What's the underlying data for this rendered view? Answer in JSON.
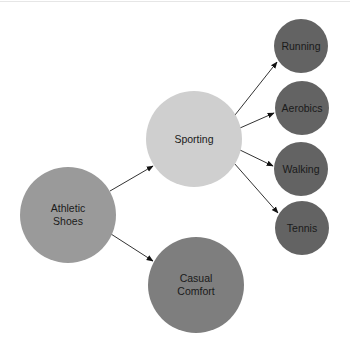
{
  "diagram": {
    "type": "hierarchy",
    "nodes": [
      {
        "id": "athletic",
        "label_lines": [
          "Athletic",
          "Shoes"
        ],
        "color": "#9a9a9a",
        "cx": 68,
        "cy": 215,
        "r": 48
      },
      {
        "id": "sporting",
        "label_lines": [
          "Sporting"
        ],
        "color": "#cfcfcf",
        "cx": 194,
        "cy": 139,
        "r": 48
      },
      {
        "id": "casual",
        "label_lines": [
          "Casual",
          "Comfort"
        ],
        "color": "#7e7e7e",
        "cx": 196,
        "cy": 285,
        "r": 48
      },
      {
        "id": "running",
        "label_lines": [
          "Running"
        ],
        "color": "#636363",
        "cx": 301,
        "cy": 46,
        "r": 27
      },
      {
        "id": "aerobics",
        "label_lines": [
          "Aerobics"
        ],
        "color": "#636363",
        "cx": 302,
        "cy": 108,
        "r": 27
      },
      {
        "id": "walking",
        "label_lines": [
          "Walking"
        ],
        "color": "#636363",
        "cx": 301,
        "cy": 169,
        "r": 27
      },
      {
        "id": "tennis",
        "label_lines": [
          "Tennis"
        ],
        "color": "#636363",
        "cx": 302,
        "cy": 228,
        "r": 27
      }
    ],
    "edges": [
      {
        "from": "athletic",
        "to": "sporting"
      },
      {
        "from": "athletic",
        "to": "casual"
      },
      {
        "from": "sporting",
        "to": "running"
      },
      {
        "from": "sporting",
        "to": "aerobics"
      },
      {
        "from": "sporting",
        "to": "walking"
      },
      {
        "from": "sporting",
        "to": "tennis"
      }
    ]
  },
  "labels": {
    "athletic_1": "Athletic",
    "athletic_2": "Shoes",
    "sporting": "Sporting",
    "casual_1": "Casual",
    "casual_2": "Comfort",
    "running": "Running",
    "aerobics": "Aerobics",
    "walking": "Walking",
    "tennis": "Tennis"
  }
}
